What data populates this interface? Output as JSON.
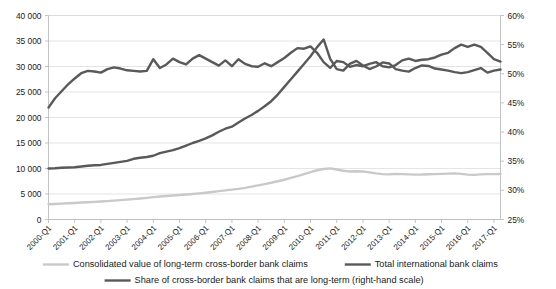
{
  "chart_data": {
    "type": "line",
    "title": "",
    "xlabel": "",
    "ylabel": "",
    "y2label": "",
    "grid": true,
    "legend_position": "bottom",
    "ylim": [
      0,
      40000
    ],
    "y2lim": [
      0.25,
      0.6
    ],
    "yticks": [
      "0",
      "5 000",
      "10 000",
      "15 000",
      "20 000",
      "25 000",
      "30 000",
      "35 000",
      "40 000"
    ],
    "ytick_values": [
      0,
      5000,
      10000,
      15000,
      20000,
      25000,
      30000,
      35000,
      40000
    ],
    "y2ticks": [
      "25%",
      "30%",
      "35%",
      "40%",
      "45%",
      "50%",
      "55%",
      "60%"
    ],
    "y2tick_values": [
      25,
      30,
      35,
      40,
      45,
      50,
      55,
      60
    ],
    "xticks": [
      "2000-Q1",
      "2001-Q1",
      "2002-Q1",
      "2003-Q1",
      "2004-Q1",
      "2005-Q1",
      "2006-Q1",
      "2007-Q1",
      "2008-Q1",
      "2009-Q1",
      "2010-Q1",
      "2011-Q1",
      "2012-Q1",
      "2013-Q1",
      "2014-Q1",
      "2015-Q1",
      "2016-Q1",
      "2017-Q1"
    ],
    "x_start_label": "2000-Q1",
    "x_end_label": "2017-Q1",
    "n_points": 70,
    "series": [
      {
        "name": "Consolidated value of long-term cross-border bank claims",
        "axis": "left",
        "color": "#c9c9c9",
        "width": 2.4,
        "values": [
          3000,
          3050,
          3120,
          3180,
          3250,
          3320,
          3380,
          3450,
          3520,
          3600,
          3700,
          3800,
          3900,
          4000,
          4120,
          4250,
          4380,
          4500,
          4620,
          4720,
          4800,
          4900,
          5000,
          5120,
          5250,
          5400,
          5560,
          5700,
          5850,
          6000,
          6200,
          6450,
          6700,
          6950,
          7200,
          7500,
          7800,
          8150,
          8500,
          8900,
          9300,
          9650,
          9900,
          10020,
          9800,
          9550,
          9400,
          9450,
          9400,
          9250,
          9050,
          8900,
          8850,
          8950,
          8900,
          8850,
          8800,
          8820,
          8880,
          8900,
          8950,
          9000,
          9050,
          8950,
          8800,
          8750,
          8850,
          8900,
          8900,
          8920
        ]
      },
      {
        "name": "Total international bank claims",
        "axis": "left",
        "color": "#595959",
        "width": 2.4,
        "values": [
          10000,
          10050,
          10150,
          10200,
          10250,
          10400,
          10550,
          10650,
          10700,
          10900,
          11100,
          11300,
          11500,
          11900,
          12100,
          12250,
          12500,
          13000,
          13300,
          13600,
          14000,
          14500,
          15000,
          15400,
          15900,
          16500,
          17200,
          17800,
          18200,
          19000,
          19800,
          20500,
          21300,
          22200,
          23200,
          24500,
          26000,
          27500,
          29000,
          30500,
          32000,
          33800,
          35300,
          31500,
          29500,
          29200,
          30500,
          31100,
          30200,
          29500,
          30000,
          30800,
          30600,
          29500,
          29200,
          29000,
          29700,
          30200,
          30100,
          29600,
          29400,
          29200,
          28900,
          28700,
          28900,
          29300,
          29700,
          28800,
          29200,
          29400
        ]
      },
      {
        "name": "Share of cross-border bank claims that are long-term (right-hand scale)",
        "axis": "right",
        "color": "#595959",
        "width": 2.4,
        "values": [
          44.2,
          45.8,
          47.0,
          48.2,
          49.2,
          50.1,
          50.5,
          50.4,
          50.2,
          50.8,
          51.1,
          50.9,
          50.6,
          50.5,
          50.4,
          50.5,
          52.5,
          51.0,
          51.6,
          52.6,
          52.0,
          51.6,
          52.6,
          53.2,
          52.6,
          52.0,
          51.4,
          52.3,
          51.3,
          52.5,
          51.7,
          51.3,
          51.2,
          51.8,
          51.3,
          52.0,
          52.7,
          53.6,
          54.4,
          54.3,
          54.7,
          53.6,
          52.0,
          51.0,
          52.2,
          52.0,
          51.2,
          51.5,
          51.3,
          51.7,
          52.0,
          51.3,
          51.1,
          51.5,
          52.3,
          52.6,
          52.2,
          52.4,
          52.5,
          52.8,
          53.3,
          53.6,
          54.4,
          55.0,
          54.6,
          55.0,
          54.6,
          53.6,
          52.5,
          52.1
        ]
      }
    ]
  },
  "legend": {
    "items": [
      {
        "label": "Consolidated value of long-term cross-border bank claims",
        "color": "#c9c9c9"
      },
      {
        "label": "Total international bank claims",
        "color": "#595959"
      },
      {
        "label": "Share of cross-border bank claims that are long-term (right-hand scale)",
        "color": "#595959"
      }
    ]
  }
}
